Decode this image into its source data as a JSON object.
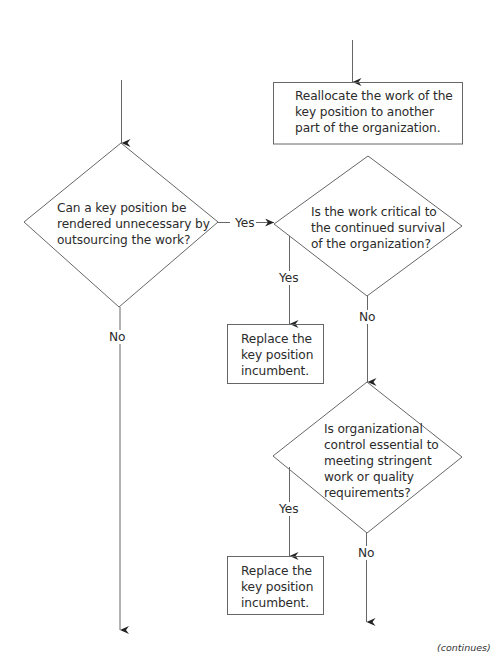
{
  "flowchart": {
    "nodes": {
      "reallocate_box": {
        "type": "process",
        "lines": [
          "Reallocate the work of the",
          "key position to another",
          "part of the organization."
        ]
      },
      "decision_outsource": {
        "type": "decision",
        "lines": [
          "Can a key position be",
          "rendered unnecessary by",
          "outsourcing the work?"
        ]
      },
      "decision_critical": {
        "type": "decision",
        "lines": [
          "Is the work critical to",
          "the continued survival",
          "of the organization?"
        ]
      },
      "replace_box_1": {
        "type": "process",
        "lines": [
          "Replace the",
          "key position",
          "incumbent."
        ]
      },
      "decision_control": {
        "type": "decision",
        "lines": [
          "Is organizational",
          "control essential to",
          "meeting stringent",
          "work or quality",
          "requirements?"
        ]
      },
      "replace_box_2": {
        "type": "process",
        "lines": [
          "Replace the",
          "key position",
          "incumbent."
        ]
      }
    },
    "edge_labels": {
      "outsource_yes": "Yes",
      "outsource_no": "No",
      "critical_yes": "Yes",
      "critical_no": "No",
      "control_yes": "Yes",
      "control_no": "No"
    },
    "edges": [
      {
        "from": "incoming-left",
        "to": "decision_outsource"
      },
      {
        "from": "incoming-right",
        "to": "reallocate_box"
      },
      {
        "from": "decision_outsource",
        "to": "decision_critical",
        "label": "Yes"
      },
      {
        "from": "decision_outsource",
        "to": "continues-left",
        "label": "No"
      },
      {
        "from": "decision_critical",
        "to": "replace_box_1",
        "label": "Yes"
      },
      {
        "from": "decision_critical",
        "to": "decision_control",
        "label": "No"
      },
      {
        "from": "decision_control",
        "to": "replace_box_2",
        "label": "Yes"
      },
      {
        "from": "decision_control",
        "to": "continues-right",
        "label": "No"
      }
    ]
  },
  "footer": {
    "continues": "(continues)"
  },
  "colors": {
    "line": "#555555",
    "text": "#2b2b2b",
    "background": "#ffffff"
  }
}
